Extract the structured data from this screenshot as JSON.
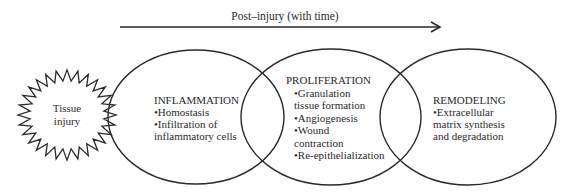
{
  "timeline": {
    "label": "Post–injury (with time)"
  },
  "injury": {
    "line1": "Tissue",
    "line2": "injury"
  },
  "phases": [
    {
      "title": "INFLAMMATION",
      "lines": [
        "•Homostasis",
        "•Infiltration of",
        "inflammatory cells"
      ]
    },
    {
      "title": "PROLIFERATION",
      "lines": [
        "•Granulation",
        "tissue formation",
        "•Angiogenesis",
        "•Wound",
        "contraction",
        "•Re-epithelialization"
      ]
    },
    {
      "title": "REMODELING",
      "lines": [
        "•Extracellular",
        "matrix synthesis",
        "and degradation"
      ]
    }
  ],
  "colors": {
    "stroke": "#2a2a2a",
    "background": "#ffffff"
  }
}
